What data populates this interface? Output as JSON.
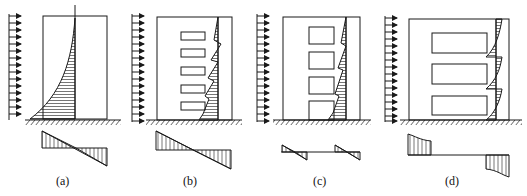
{
  "figure": {
    "colors": {
      "stroke": "#1a1a1a",
      "background": "#ffffff"
    },
    "panels": [
      {
        "id": "a",
        "label": "(a)",
        "windows": 0,
        "type": "solid wall"
      },
      {
        "id": "b",
        "label": "(b)",
        "windows": 5,
        "type": "wall with small openings"
      },
      {
        "id": "c",
        "label": "(c)",
        "windows": 4,
        "type": "coupled wall"
      },
      {
        "id": "d",
        "label": "(d)",
        "windows": 3,
        "type": "wall-frame with large openings"
      }
    ]
  }
}
